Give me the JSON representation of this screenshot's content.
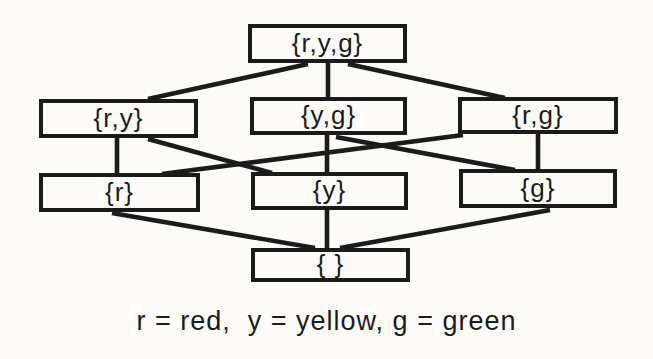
{
  "figure": {
    "ink_color": "#1b1b1b",
    "background_color": "#fcfbf8",
    "caption": "r = red,  y = yellow, g = green",
    "diagram": {
      "type": "hasse-lattice",
      "nodes": [
        {
          "id": "ryg",
          "label": "{r,y,g}",
          "x": 248,
          "y": 24,
          "w": 159,
          "h": 39
        },
        {
          "id": "ry",
          "label": "{r,y}",
          "x": 39,
          "y": 99,
          "w": 159,
          "h": 39
        },
        {
          "id": "yg",
          "label": "{y,g}",
          "x": 250,
          "y": 97,
          "w": 157,
          "h": 38
        },
        {
          "id": "rg",
          "label": "{r,g}",
          "x": 458,
          "y": 97,
          "w": 160,
          "h": 37
        },
        {
          "id": "r",
          "label": "{r}",
          "x": 39,
          "y": 173,
          "w": 161,
          "h": 39
        },
        {
          "id": "y",
          "label": "{y}",
          "x": 251,
          "y": 172,
          "w": 157,
          "h": 38
        },
        {
          "id": "g",
          "label": "{g}",
          "x": 459,
          "y": 169,
          "w": 158,
          "h": 39
        },
        {
          "id": "empty",
          "label": "{ }",
          "x": 251,
          "y": 248,
          "w": 159,
          "h": 34
        }
      ],
      "edges": [
        {
          "from": "ryg",
          "to": "ry",
          "x1": 308,
          "y1": 64,
          "x2": 148,
          "y2": 99
        },
        {
          "from": "ryg",
          "to": "yg",
          "x1": 328,
          "y1": 63,
          "x2": 328,
          "y2": 98
        },
        {
          "from": "ryg",
          "to": "rg",
          "x1": 348,
          "y1": 64,
          "x2": 505,
          "y2": 98
        },
        {
          "from": "ry",
          "to": "r",
          "x1": 117,
          "y1": 137,
          "x2": 117,
          "y2": 174
        },
        {
          "from": "ry",
          "to": "y",
          "x1": 148,
          "y1": 139,
          "x2": 272,
          "y2": 173
        },
        {
          "from": "yg",
          "to": "y",
          "x1": 327,
          "y1": 134,
          "x2": 327,
          "y2": 173
        },
        {
          "from": "yg",
          "to": "g",
          "x1": 336,
          "y1": 137,
          "x2": 515,
          "y2": 170
        },
        {
          "from": "rg",
          "to": "r",
          "x1": 463,
          "y1": 135,
          "x2": 162,
          "y2": 174
        },
        {
          "from": "rg",
          "to": "g",
          "x1": 538,
          "y1": 133,
          "x2": 538,
          "y2": 170
        },
        {
          "from": "r",
          "to": "empty",
          "x1": 112,
          "y1": 213,
          "x2": 315,
          "y2": 248
        },
        {
          "from": "y",
          "to": "empty",
          "x1": 327,
          "y1": 210,
          "x2": 327,
          "y2": 248
        },
        {
          "from": "g",
          "to": "empty",
          "x1": 550,
          "y1": 210,
          "x2": 340,
          "y2": 248
        }
      ]
    }
  }
}
